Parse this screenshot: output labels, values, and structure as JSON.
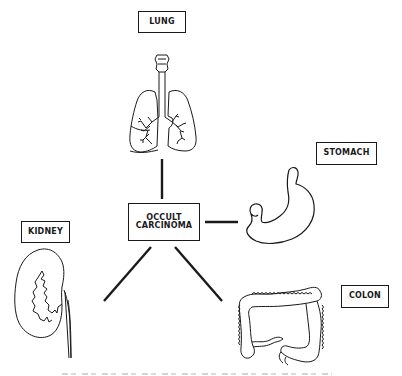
{
  "diagram": {
    "center_node": {
      "line1": "OCCULT",
      "line2": "CARCINOMA"
    },
    "nodes": [
      {
        "id": "lung",
        "label": "LUNG",
        "icon": "lungs-illustration"
      },
      {
        "id": "stomach",
        "label": "STOMACH",
        "icon": "stomach-illustration"
      },
      {
        "id": "kidney",
        "label": "KIDNEY",
        "icon": "kidney-illustration"
      },
      {
        "id": "colon",
        "label": "COLON",
        "icon": "colon-illustration"
      }
    ],
    "colors": {
      "ink": "#1a1a1a",
      "background": "#ffffff"
    }
  }
}
